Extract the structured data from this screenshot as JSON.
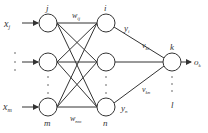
{
  "diagram": {
    "line_color": "#333333",
    "background": "#ffffff",
    "inputs": {
      "first": {
        "label": "x",
        "sub": "j"
      },
      "last": {
        "label": "x",
        "sub": "m"
      },
      "dots": "⋮"
    },
    "input_layer": {
      "top_node": "j",
      "bottom_node": "m"
    },
    "hidden_layer": {
      "top_node": "i",
      "bottom_node": "n"
    },
    "output_layer": {
      "node": "k",
      "bottom_node": "l"
    },
    "weights": {
      "w_top": {
        "label": "w",
        "sub": "ij"
      },
      "w_bottom": {
        "label": "w",
        "sub": "nm"
      },
      "v_top": {
        "label": "v",
        "sub": "ki"
      },
      "v_bottom": {
        "label": "v",
        "sub": "kn"
      }
    },
    "hidden_outputs": {
      "top": {
        "label": "y",
        "sub": "i"
      },
      "bottom": {
        "label": "y",
        "sub": "n"
      }
    },
    "output": {
      "label": "o",
      "sub": "k"
    }
  }
}
